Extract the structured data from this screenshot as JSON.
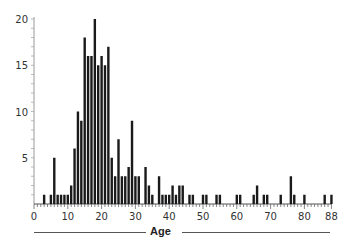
{
  "chart_data": {
    "type": "bar",
    "title": "",
    "xlabel": "Age",
    "ylabel": "",
    "xlim": [
      0,
      88
    ],
    "ylim": [
      0,
      20
    ],
    "x_ticks": [
      0,
      10,
      20,
      30,
      40,
      50,
      60,
      70,
      80,
      88
    ],
    "y_ticks": [
      5,
      10,
      15,
      20
    ],
    "grid": false,
    "bar_color": "#1a1a1a",
    "x": [
      3,
      5,
      6,
      7,
      8,
      9,
      10,
      11,
      12,
      13,
      14,
      15,
      16,
      17,
      18,
      19,
      20,
      21,
      22,
      23,
      24,
      25,
      26,
      27,
      28,
      29,
      30,
      31,
      33,
      34,
      35,
      37,
      38,
      39,
      40,
      41,
      42,
      43,
      44,
      46,
      47,
      50,
      51,
      54,
      55,
      60,
      61,
      65,
      66,
      68,
      69,
      73,
      76,
      77,
      80,
      86,
      88
    ],
    "values": [
      1,
      1,
      5,
      1,
      1,
      1,
      1,
      2,
      6,
      10,
      9,
      18,
      16,
      16,
      20,
      15,
      16,
      15,
      17,
      5,
      3,
      7,
      3,
      3,
      4,
      9,
      3,
      3,
      4,
      2,
      1,
      3,
      1,
      1,
      1,
      2,
      1,
      2,
      2,
      1,
      1,
      1,
      1,
      1,
      1,
      1,
      1,
      1,
      2,
      1,
      1,
      1,
      3,
      1,
      1,
      1,
      1
    ]
  },
  "axis": {
    "xlabel": "Age"
  }
}
